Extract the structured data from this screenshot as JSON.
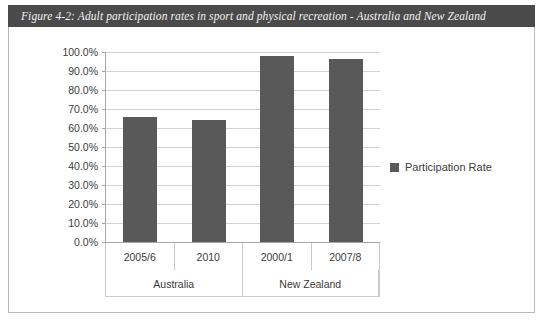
{
  "figure": {
    "caption": "Figure 4-2: Adult participation rates in sport and physical recreation - Australia and New Zealand",
    "caption_bg": "#4a4a4a",
    "caption_color": "#f2f2f2",
    "border_color": "#b9b9b9"
  },
  "chart_data": {
    "type": "bar",
    "title": "Figure 4-2: Adult participation rates in sport and physical recreation - Australia and New Zealand",
    "xlabel": "",
    "ylabel": "",
    "categories": [
      "2005/6",
      "2010",
      "2000/1",
      "2007/8"
    ],
    "groups": [
      {
        "label": "Australia",
        "categories": [
          "2005/6",
          "2010"
        ]
      },
      {
        "label": "New Zealand",
        "categories": [
          "2000/1",
          "2007/8"
        ]
      }
    ],
    "series": [
      {
        "name": "Participation Rate",
        "color": "#595959",
        "values": [
          66.0,
          64.0,
          98.0,
          96.5
        ]
      }
    ],
    "values": [
      66.0,
      64.0,
      98.0,
      96.5
    ],
    "ylim": [
      0,
      100
    ],
    "ytick_step": 10,
    "ytick_labels": [
      "100.0%",
      "90.0%",
      "80.0%",
      "70.0%",
      "60.0%",
      "50.0%",
      "40.0%",
      "30.0%",
      "20.0%",
      "10.0%",
      "0.0%"
    ],
    "ytick_values": [
      100,
      90,
      80,
      70,
      60,
      50,
      40,
      30,
      20,
      10,
      0
    ],
    "grid": true,
    "grid_color": "#d2d2d2",
    "axis_color": "#a6a6a6",
    "legend": {
      "position": "right",
      "entries": [
        {
          "label": "Participation Rate",
          "color": "#595959"
        }
      ]
    }
  }
}
